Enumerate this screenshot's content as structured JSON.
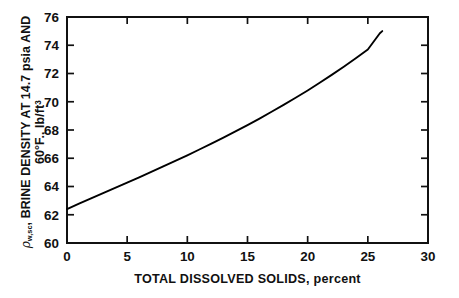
{
  "chart_data": {
    "type": "line",
    "title": "",
    "xlabel_main": "TOTAL DISSOLVED SOLIDS,",
    "xlabel_unit": "percent",
    "ylabel_symbol": "ρ",
    "ylabel_subscript": "w,sc",
    "ylabel_line1": ", BRINE DENSITY AT 14.7 psia AND",
    "ylabel_line2_main": "60°F., lb/ft",
    "ylabel_line2_sup": "3",
    "xlim": [
      0,
      30
    ],
    "ylim": [
      60,
      76
    ],
    "xticks": [
      0,
      5,
      10,
      15,
      20,
      25,
      30
    ],
    "xtick_labels": [
      "0",
      "5",
      "10",
      "15",
      "20",
      "25",
      "30"
    ],
    "yticks": [
      60,
      62,
      64,
      66,
      68,
      70,
      72,
      74,
      76
    ],
    "ytick_labels": [
      "60",
      "62",
      "64",
      "66",
      "68",
      "70",
      "72",
      "74",
      "76"
    ],
    "grid": false,
    "legend": "none",
    "frame": "box-all-sides-inward-ticks",
    "series": [
      {
        "name": "brine density",
        "color": "#000000",
        "x": [
          0,
          1,
          2,
          3,
          4,
          5,
          6,
          7,
          8,
          9,
          10,
          11,
          12,
          13,
          14,
          15,
          16,
          17,
          18,
          19,
          20,
          21,
          22,
          23,
          24,
          25,
          26,
          26.2
        ],
        "y": [
          62.4,
          62.78,
          63.16,
          63.53,
          63.9,
          64.27,
          64.65,
          65.03,
          65.42,
          65.81,
          66.21,
          66.62,
          67.04,
          67.46,
          67.9,
          68.35,
          68.81,
          69.29,
          69.78,
          70.28,
          70.8,
          71.34,
          71.9,
          72.48,
          73.08,
          73.7,
          74.85,
          75.0
        ]
      }
    ]
  },
  "axes": {
    "x_tick_labels": [
      "0",
      "5",
      "10",
      "15",
      "20",
      "25",
      "30"
    ],
    "y_tick_labels": [
      "60",
      "62",
      "64",
      "66",
      "68",
      "70",
      "72",
      "74",
      "76"
    ]
  },
  "labels": {
    "x_axis_title_main": "TOTAL DISSOLVED SOLIDS,",
    "x_axis_title_unit": "percent",
    "y_axis_symbol": "ρ",
    "y_axis_symbol_sub": "w,sc",
    "y_axis_line1": ", BRINE DENSITY AT 14.7 psia AND",
    "y_axis_line2": "60°F., lb/ft",
    "y_axis_line2_sup": "3"
  },
  "caption": {
    "text": ""
  }
}
